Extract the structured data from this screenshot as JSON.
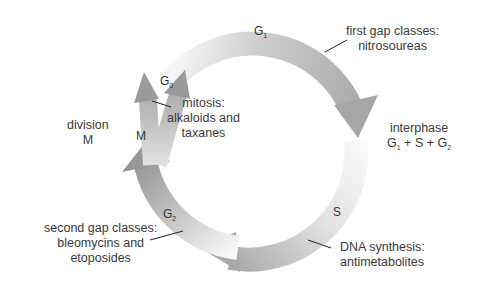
{
  "colors": {
    "arc_dark": "#9a9a9a",
    "arc_light": "#f4f4f4",
    "text": "#3a3a3a",
    "leader": "#222222"
  },
  "phases": {
    "g0": {
      "letter": "G",
      "sub": "0"
    },
    "g1": {
      "letter": "G",
      "sub": "1"
    },
    "g2": {
      "letter": "G",
      "sub": "2"
    },
    "s": {
      "letter": "S"
    },
    "m": {
      "letter": "M"
    }
  },
  "annotations": {
    "first_gap": {
      "line1": "first gap classes:",
      "line2": "nitrosoureas"
    },
    "interphase": {
      "line1": "interphase",
      "g1": "G",
      "g1_sub": "1",
      "plus_s": " + S + ",
      "g2": "G",
      "g2_sub": "2"
    },
    "dna_synthesis": {
      "line1": "DNA synthesis:",
      "line2": "antimetabolites"
    },
    "second_gap": {
      "line1": "second gap classes:",
      "line2": "bleomycins and",
      "line3": "etoposides"
    },
    "mitosis": {
      "line1": "mitosis:",
      "line2": "alkaloids and",
      "line3": "taxanes"
    },
    "division": {
      "line1": "division",
      "line2": "M"
    }
  }
}
